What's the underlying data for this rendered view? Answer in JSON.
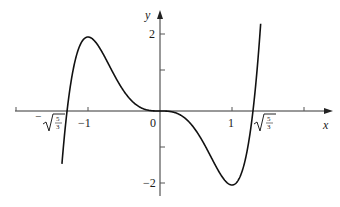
{
  "chart_data": {
    "type": "line",
    "title": "",
    "function": "y = 3x^5 - 5x^3",
    "xlabel": "x",
    "ylabel": "y",
    "xlim": [
      -2.0,
      2.35
    ],
    "ylim": [
      -2.5,
      2.7
    ],
    "x_ticks": [
      -2,
      -1,
      0,
      1,
      2
    ],
    "x_tick_labels": [
      {
        "x": -1.291,
        "label": "−√(5/3)"
      },
      {
        "x": -1,
        "label": "−1"
      },
      {
        "x": 0,
        "label": "0"
      },
      {
        "x": 1,
        "label": "1"
      },
      {
        "x": 1.291,
        "label": "√(5/3)"
      }
    ],
    "y_ticks": [
      -2,
      -1,
      1,
      2
    ],
    "y_tick_labels": [
      {
        "y": 2,
        "label": "2"
      },
      {
        "y": -2,
        "label": "−2"
      }
    ],
    "key_points": [
      {
        "x": -1.291,
        "y": 0,
        "note": "zero"
      },
      {
        "x": -1,
        "y": 2,
        "note": "local max"
      },
      {
        "x": 0,
        "y": 0,
        "note": "inflection / zero"
      },
      {
        "x": 1,
        "y": -2,
        "note": "local min"
      },
      {
        "x": 1.291,
        "y": 0,
        "note": "zero"
      }
    ],
    "series": [
      {
        "name": "f(x)",
        "x": [
          -1.36,
          -1.3,
          -1.2,
          -1.1,
          -1.0,
          -0.9,
          -0.8,
          -0.6,
          -0.4,
          -0.2,
          0,
          0.2,
          0.4,
          0.6,
          0.8,
          0.9,
          1.0,
          1.1,
          1.2,
          1.3,
          1.4
        ],
        "values": [
          -2.35,
          -0.11,
          1.2,
          1.82,
          2.0,
          1.87,
          1.58,
          0.85,
          0.29,
          0.04,
          0,
          -0.04,
          -0.29,
          -0.85,
          -1.58,
          -1.87,
          -2.0,
          -1.82,
          -1.2,
          0.11,
          2.37
        ]
      }
    ],
    "grid": false,
    "legend": null
  },
  "axes": {
    "x_label": "x",
    "y_label": "y",
    "labels": {
      "neg_sqrt_sign": "−",
      "sqrt_num": "5",
      "sqrt_den": "3",
      "neg_one": "−1",
      "zero": "0",
      "one": "1",
      "two": "2",
      "neg_two": "−2"
    }
  }
}
